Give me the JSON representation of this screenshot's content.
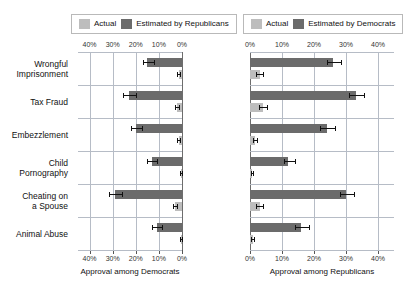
{
  "legends": [
    {
      "name": "republicans-legend",
      "items": [
        {
          "label": "Actual",
          "color": "#bdbdbd"
        },
        {
          "label": "Estimated by Republicans",
          "color": "#6b6b6b"
        }
      ]
    },
    {
      "name": "democrats-legend",
      "items": [
        {
          "label": "Actual",
          "color": "#bdbdbd"
        },
        {
          "label": "Estimated by Democrats",
          "color": "#6b6b6b"
        }
      ]
    }
  ],
  "categories": [
    "Wrongful\nImprisonment",
    "Tax Fraud",
    "Embezzlement",
    "Child\nPornography",
    "Cheating on\na Spouse",
    "Animal Abuse"
  ],
  "left_panel": {
    "xlabel": "Approval among Democrats",
    "ticks": [
      "40%",
      "30%",
      "20%",
      "10%",
      "0%"
    ],
    "tick_values": [
      40,
      30,
      20,
      10,
      0
    ]
  },
  "right_panel": {
    "xlabel": "Approval among Republicans",
    "ticks": [
      "0%",
      "10%",
      "20%",
      "30%",
      "40%"
    ],
    "tick_values": [
      0,
      10,
      20,
      30,
      40
    ]
  },
  "chart_data": {
    "type": "bar",
    "title": "",
    "orientation": "horizontal",
    "layout": "diverging-paired-panels",
    "grid": true,
    "legend_position": "top",
    "categories": [
      "Wrongful Imprisonment",
      "Tax Fraud",
      "Embezzlement",
      "Child Pornography",
      "Cheating on a Spouse",
      "Animal Abuse"
    ],
    "panels": [
      {
        "name": "Approval among Democrats",
        "xlabel": "Approval among Democrats",
        "direction": "left",
        "xlim": [
          0,
          45
        ],
        "ticks": [
          40,
          30,
          20,
          10,
          0
        ],
        "series": [
          {
            "name": "Estimated by Republicans",
            "color": "#6b6b6b",
            "values": [
              15.0,
              23.0,
              20.0,
              13.0,
              29.0,
              11.0
            ],
            "err_low": [
              12.0,
              20.0,
              17.5,
              11.0,
              26.0,
              8.5
            ],
            "err_high": [
              17.0,
              25.5,
              22.0,
              15.0,
              31.5,
              13.0
            ]
          },
          {
            "name": "Actual",
            "color": "#bdbdbd",
            "values": [
              1.5,
              2.0,
              1.5,
              0.5,
              3.0,
              0.5
            ],
            "err_low": [
              0.8,
              1.2,
              0.8,
              0.2,
              2.0,
              0.2
            ],
            "err_high": [
              2.3,
              2.9,
              2.3,
              0.9,
              4.0,
              0.9
            ]
          }
        ]
      },
      {
        "name": "Approval among Republicans",
        "xlabel": "Approval among Republicans",
        "direction": "right",
        "xlim": [
          0,
          45
        ],
        "ticks": [
          0,
          10,
          20,
          30,
          40
        ],
        "series": [
          {
            "name": "Estimated by Democrats",
            "color": "#6b6b6b",
            "values": [
              26.0,
              33.0,
              24.0,
              12.0,
              30.0,
              16.0
            ],
            "err_low": [
              24.0,
              31.0,
              22.0,
              10.5,
              28.0,
              14.0
            ],
            "err_high": [
              28.5,
              35.5,
              26.5,
              14.0,
              32.5,
              18.5
            ]
          },
          {
            "name": "Actual",
            "color": "#bdbdbd",
            "values": [
              3.0,
              4.0,
              1.5,
              0.5,
              3.0,
              0.8
            ],
            "err_low": [
              2.0,
              2.8,
              0.8,
              0.2,
              2.0,
              0.3
            ],
            "err_high": [
              4.2,
              5.2,
              2.3,
              1.0,
              4.2,
              1.4
            ]
          }
        ]
      }
    ]
  }
}
